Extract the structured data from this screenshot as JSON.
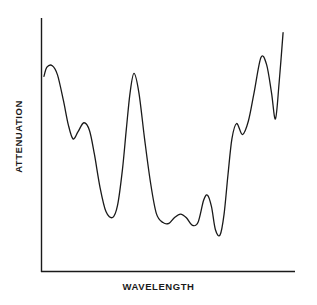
{
  "chart_data": {
    "type": "line",
    "title": "",
    "subtitle": "",
    "xlabel": "WAVELENGTH",
    "ylabel": "ATTENUATION",
    "grid": false,
    "legend": null,
    "legend_position": "none",
    "axis_style": "open-left-bottom",
    "xlim": [
      0,
      1
    ],
    "ylim": [
      0,
      1
    ],
    "xticks": [],
    "yticks": [],
    "xtick_labels": [],
    "ytick_labels": [],
    "annotations": [],
    "line_color": "#1a1a1a",
    "line_width": 1.3,
    "series": [
      {
        "name": "attenuation-spectrum",
        "x": [
          0.008,
          0.02,
          0.042,
          0.063,
          0.087,
          0.107,
          0.126,
          0.146,
          0.17,
          0.193,
          0.213,
          0.236,
          0.26,
          0.287,
          0.307,
          0.327,
          0.343,
          0.358,
          0.374,
          0.394,
          0.417,
          0.441,
          0.465,
          0.492,
          0.516,
          0.539,
          0.563,
          0.587,
          0.61,
          0.634,
          0.657,
          0.673,
          0.689,
          0.705,
          0.724,
          0.74,
          0.756,
          0.772,
          0.791,
          0.815,
          0.839,
          0.862,
          0.89,
          0.913,
          0.933,
          0.949,
          0.964,
          0.98
        ],
        "y": [
          0.764,
          0.8,
          0.806,
          0.77,
          0.67,
          0.575,
          0.52,
          0.547,
          0.583,
          0.553,
          0.46,
          0.33,
          0.236,
          0.213,
          0.26,
          0.4,
          0.56,
          0.7,
          0.776,
          0.7,
          0.52,
          0.35,
          0.228,
          0.193,
          0.19,
          0.213,
          0.226,
          0.212,
          0.183,
          0.193,
          0.28,
          0.3,
          0.255,
          0.165,
          0.145,
          0.225,
          0.38,
          0.52,
          0.58,
          0.537,
          0.59,
          0.7,
          0.838,
          0.81,
          0.7,
          0.598,
          0.74,
          0.935
        ]
      }
    ]
  },
  "figure": {
    "background_color": "#ffffff",
    "text_color": "#1a1a1a"
  }
}
